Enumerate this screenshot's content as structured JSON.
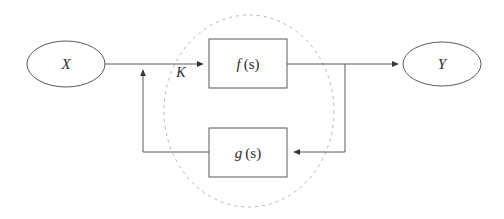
{
  "diagram": {
    "background_color": "#ffffff",
    "stroke_color": "#555555",
    "text_color": "#2b2b2b",
    "dashed_color": "#b4b4b4",
    "nodes": {
      "input": {
        "label": "X",
        "cx": 66,
        "cy": 64,
        "rx": 39,
        "ry": 23
      },
      "output": {
        "label": "Y",
        "cx": 442,
        "cy": 64,
        "rx": 39,
        "ry": 22
      }
    },
    "blocks": {
      "forward": {
        "label_fn": "f",
        "label_arg": "(s)",
        "x": 209,
        "y": 39,
        "width": 78,
        "height": 49
      },
      "feedback": {
        "label_fn": "g",
        "label_arg": "(s)",
        "x": 209,
        "y": 128,
        "width": 78,
        "height": 49
      }
    },
    "gain": {
      "label": "K",
      "x": 181,
      "y": 77
    },
    "grouping": {
      "name": "closed-loop-group",
      "cx": 249,
      "cy": 111,
      "rx": 85,
      "ry": 96,
      "style": "dashed"
    },
    "signals": [
      {
        "name": "input-to-summing",
        "from": "X",
        "to": "summing-junction"
      },
      {
        "name": "summing-to-forward-block",
        "from": "summing-junction",
        "to": "f(s)"
      },
      {
        "name": "forward-block-to-output",
        "from": "f(s)",
        "to": "Y"
      },
      {
        "name": "output-tap-to-feedback-block",
        "from": "output-tap",
        "to": "g(s)"
      },
      {
        "name": "feedback-block-to-summing",
        "from": "g(s)",
        "to": "summing-junction"
      }
    ]
  }
}
